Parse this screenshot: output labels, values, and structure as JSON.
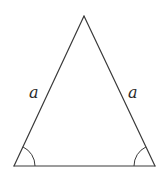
{
  "diagram": {
    "type": "isosceles-triangle",
    "vertices": {
      "apex": {
        "x": 84,
        "y": 16
      },
      "bottom_left": {
        "x": 14,
        "y": 166
      },
      "bottom_right": {
        "x": 155,
        "y": 166
      }
    },
    "side_labels": {
      "left": "a",
      "right": "a"
    },
    "angle_marks": [
      {
        "vertex": "bottom_left",
        "type": "single-arc"
      },
      {
        "vertex": "bottom_right",
        "type": "single-arc"
      }
    ],
    "colors": {
      "stroke": "#3a3a3a",
      "label": "#2a2a2a",
      "background": "#ffffff"
    }
  }
}
